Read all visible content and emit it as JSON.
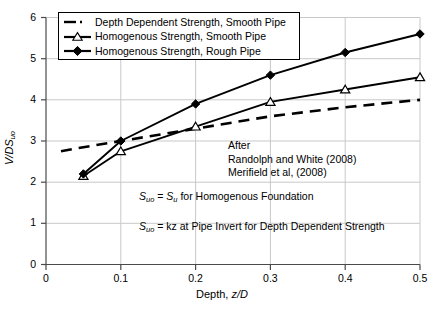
{
  "chart_data": {
    "type": "line",
    "title": "",
    "xlabel": "Depth, z/D",
    "ylabel": "V/DS_uo",
    "xlim": [
      0,
      0.5
    ],
    "ylim": [
      0,
      6
    ],
    "xticks": [
      "0",
      "0.1",
      "0.2",
      "0.3",
      "0.4",
      "0.5"
    ],
    "xtick_values": [
      0,
      0.1,
      0.2,
      0.3,
      0.4,
      0.5
    ],
    "yticks": [
      "0",
      "1",
      "2",
      "3",
      "4",
      "5",
      "6"
    ],
    "ytick_values": [
      0,
      1,
      2,
      3,
      4,
      5,
      6
    ],
    "grid": true,
    "legend_position": "upper-left",
    "series": [
      {
        "name": "Depth Dependent Strength, Smooth Pipe",
        "marker": "none",
        "linestyle": "dashed",
        "color": "#000000",
        "x": [
          0.02,
          0.05,
          0.1,
          0.2,
          0.3,
          0.4,
          0.5
        ],
        "values": [
          2.75,
          2.85,
          3.0,
          3.3,
          3.6,
          3.82,
          4.0
        ]
      },
      {
        "name": "Homogenous Strength, Smooth Pipe",
        "marker": "open-triangle",
        "linestyle": "solid",
        "color": "#000000",
        "x": [
          0.05,
          0.1,
          0.2,
          0.3,
          0.4,
          0.5
        ],
        "values": [
          2.15,
          2.75,
          3.35,
          3.95,
          4.25,
          4.55
        ]
      },
      {
        "name": "Homogenous Strength, Rough Pipe",
        "marker": "filled-diamond",
        "linestyle": "solid",
        "color": "#000000",
        "x": [
          0.05,
          0.1,
          0.2,
          0.3,
          0.4,
          0.5
        ],
        "values": [
          2.2,
          3.0,
          3.9,
          4.6,
          5.15,
          5.6
        ]
      }
    ],
    "annotations": [
      {
        "id": "after",
        "text": "After"
      },
      {
        "id": "ref1",
        "text": "Randolph and White (2008)"
      },
      {
        "id": "ref2",
        "text": "Merifield et al, (2008)"
      },
      {
        "id": "eq1",
        "text": "S_uo = S_u for Homogenous Foundation"
      },
      {
        "id": "eq2",
        "text": "S_uo = kz at Pipe Invert for Depth Dependent Strength"
      }
    ]
  },
  "labels": {
    "ylabel_main": "V/DS",
    "ylabel_sub": "uo",
    "xlabel_prefix": "Depth, ",
    "xlabel_ital": "z/D",
    "eq1_sym1": "S",
    "eq1_sub1": "uo",
    "eq1_mid": " = ",
    "eq1_sym2": "S",
    "eq1_sub2": "u",
    "eq1_tail": " for Homogenous Foundation",
    "eq2_sym1": "S",
    "eq2_sub1": "uo",
    "eq2_tail": " = kz at Pipe Invert for Depth Dependent Strength",
    "annot_after": "After",
    "annot_ref1": "Randolph and White (2008)",
    "annot_ref2": "Merifield et al, (2008)"
  },
  "colors": {
    "axis": "#000000",
    "grid": "#c8c8c8",
    "line": "#000000",
    "background": "#ffffff"
  }
}
